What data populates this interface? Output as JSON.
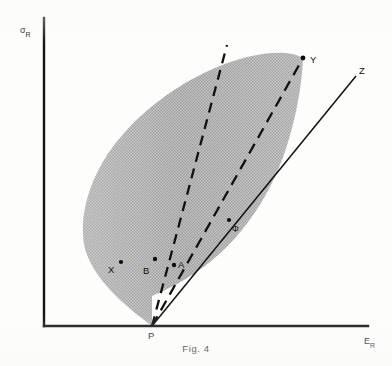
{
  "figure": {
    "caption": "Fig. 4",
    "axes": {
      "y_label_symbol": "σ",
      "y_label_subscript": "R",
      "x_label_symbol": "E",
      "x_label_subscript": "R",
      "y_axis": {
        "x": 44,
        "y_top": 18,
        "y_bottom": 326
      },
      "x_axis": {
        "y": 326,
        "x_left": 44,
        "x_right": 368
      }
    },
    "colors": {
      "ink": "#111111",
      "axis": "#141414",
      "region_fill": "#b9b9b9",
      "background": "#fdfdfc"
    },
    "region": {
      "name": "feasible-region",
      "fill_style": "halftone-stipple",
      "path": "M 152 326 C 120 302, 96 280, 86 252 C 78 224, 86 190, 104 160 C 126 124, 164 92, 206 72 C 248 52, 286 48, 303 58 C 302 84, 296 122, 282 160 C 266 202, 240 238, 210 262 C 186 281, 166 290, 152 296 Z"
    },
    "rays": [
      {
        "name": "ray-PB-extended",
        "style": "dashed",
        "from_label": "P",
        "through_label": "B",
        "x1": 152,
        "y1": 326,
        "x2": 227,
        "y2": 45
      },
      {
        "name": "ray-PA-Y",
        "style": "dashed",
        "from_label": "P",
        "through_label": "A",
        "x1": 152,
        "y1": 326,
        "x2": 303,
        "y2": 58
      },
      {
        "name": "ray-P-phi-Z",
        "style": "solid",
        "from_label": "P",
        "through_label": "Φ",
        "x1": 152,
        "y1": 326,
        "x2": 356,
        "y2": 76
      }
    ],
    "points": [
      {
        "label": "X",
        "dot_x": 121,
        "dot_y": 262,
        "label_x": 108,
        "label_y": 273,
        "has_dot": true
      },
      {
        "label": "B",
        "dot_x": 155,
        "dot_y": 259,
        "label_x": 143,
        "label_y": 274,
        "has_dot": true
      },
      {
        "label": "A",
        "dot_x": 174,
        "dot_y": 265,
        "label_x": 178,
        "label_y": 268,
        "has_dot": true
      },
      {
        "label": "Φ",
        "dot_x": 229,
        "dot_y": 220,
        "label_x": 232,
        "label_y": 232,
        "has_dot": true
      },
      {
        "label": "Y",
        "dot_x": 303,
        "dot_y": 58,
        "label_x": 310,
        "label_y": 63,
        "has_dot": true
      },
      {
        "label": "Z",
        "dot_x": 0,
        "dot_y": 0,
        "label_x": 359,
        "label_y": 74,
        "has_dot": false
      },
      {
        "label": "P",
        "dot_x": 0,
        "dot_y": 0,
        "label_x": 148,
        "label_y": 339,
        "has_dot": false
      }
    ],
    "caption_position": {
      "x": 196,
      "y": 352
    }
  }
}
